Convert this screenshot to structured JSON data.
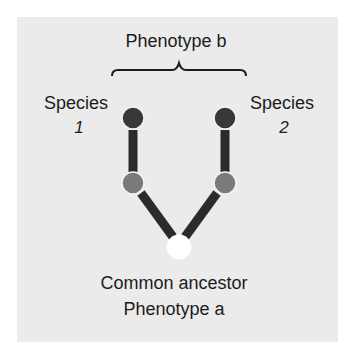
{
  "diagram": {
    "top_label": "Phenotype b",
    "species_left": {
      "name": "Species",
      "number": "1"
    },
    "species_right": {
      "name": "Species",
      "number": "2"
    },
    "bottom_label_line1": "Common ancestor",
    "bottom_label_line2": "Phenotype a",
    "colors": {
      "background": "#ebebeb",
      "branch": "#2b2b2b",
      "node_derived": "#383838",
      "node_intermediate": "#7a7a7a",
      "node_ancestor": "#ffffff"
    },
    "nodes": [
      {
        "id": "species1-tip",
        "phenotype": "b",
        "shade": "dark"
      },
      {
        "id": "species1-intermediate",
        "shade": "grey"
      },
      {
        "id": "species2-tip",
        "phenotype": "b",
        "shade": "dark"
      },
      {
        "id": "species2-intermediate",
        "shade": "grey"
      },
      {
        "id": "common-ancestor",
        "phenotype": "a",
        "shade": "white"
      }
    ]
  }
}
